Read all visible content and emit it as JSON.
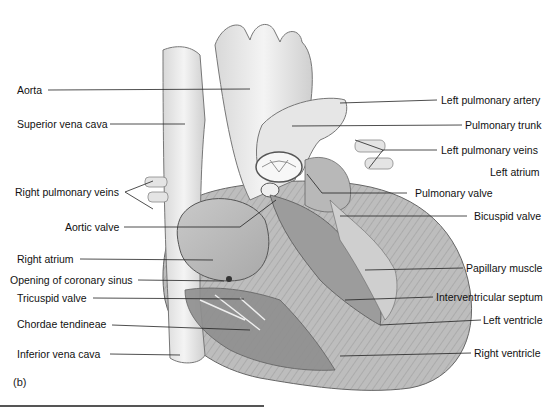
{
  "figure": {
    "panel_label": "(b)",
    "left_labels": [
      {
        "id": "aorta",
        "text": "Aorta"
      },
      {
        "id": "superior-vena-cava",
        "text": "Superior vena cava"
      },
      {
        "id": "right-pulmonary-veins",
        "text": "Right pulmonary veins"
      },
      {
        "id": "aortic-valve",
        "text": "Aortic valve"
      },
      {
        "id": "right-atrium",
        "text": "Right atrium"
      },
      {
        "id": "opening-coronary-sinus",
        "text": "Opening of coronary sinus"
      },
      {
        "id": "tricuspid-valve",
        "text": "Tricuspid valve"
      },
      {
        "id": "chordae-tendineae",
        "text": "Chordae tendineae"
      },
      {
        "id": "inferior-vena-cava",
        "text": "Inferior vena cava"
      }
    ],
    "right_labels": [
      {
        "id": "left-pulmonary-artery",
        "text": "Left pulmonary artery"
      },
      {
        "id": "pulmonary-trunk",
        "text": "Pulmonary trunk"
      },
      {
        "id": "left-pulmonary-veins",
        "text": "Left pulmonary veins"
      },
      {
        "id": "left-atrium",
        "text": "Left atrium"
      },
      {
        "id": "pulmonary-valve",
        "text": "Pulmonary valve"
      },
      {
        "id": "bicuspid-valve",
        "text": "Bicuspid valve"
      },
      {
        "id": "papillary-muscle",
        "text": "Papillary muscle"
      },
      {
        "id": "interventricular-septum",
        "text": "Interventricular septum"
      },
      {
        "id": "left-ventricle",
        "text": "Left ventricle"
      },
      {
        "id": "right-ventricle",
        "text": "Right ventricle"
      }
    ]
  }
}
